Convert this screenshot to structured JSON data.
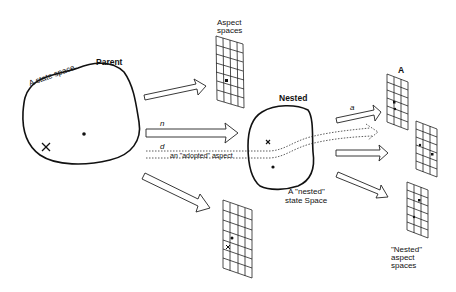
{
  "diagram": {
    "parent": {
      "title": "Parent",
      "caption": "A state space",
      "markers": [
        "x",
        "dot"
      ]
    },
    "aspect_spaces_top": {
      "label_line1": "Aspect",
      "label_line2": "spaces"
    },
    "arrows": {
      "n_label": "n",
      "d_label": "d",
      "adopted_label": "an \"adopted\" aspect",
      "a_label": "a"
    },
    "nested": {
      "title": "Nested",
      "caption_line1": "A \"nested\"",
      "caption_line2": "state  Space"
    },
    "nested_aspects": {
      "top_label": "A",
      "caption_line1": "\"Nested\"",
      "caption_line2": "aspect",
      "caption_line3": "spaces"
    },
    "colors": {
      "stroke": "#111111",
      "background": "#ffffff"
    }
  }
}
